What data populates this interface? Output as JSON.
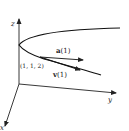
{
  "diagram": {
    "type": "3d-space-curve",
    "axes": {
      "x_label": "x",
      "y_label": "y",
      "z_label": "z"
    },
    "point_label": "(1, 1, 2)",
    "vectors": [
      {
        "name": "acceleration",
        "label_bold": "a",
        "label_arg": "(1)"
      },
      {
        "name": "velocity",
        "label_bold": "v",
        "label_arg": "(1)"
      }
    ],
    "colors": {
      "stroke": "#222222",
      "background": "#ffffff"
    }
  }
}
